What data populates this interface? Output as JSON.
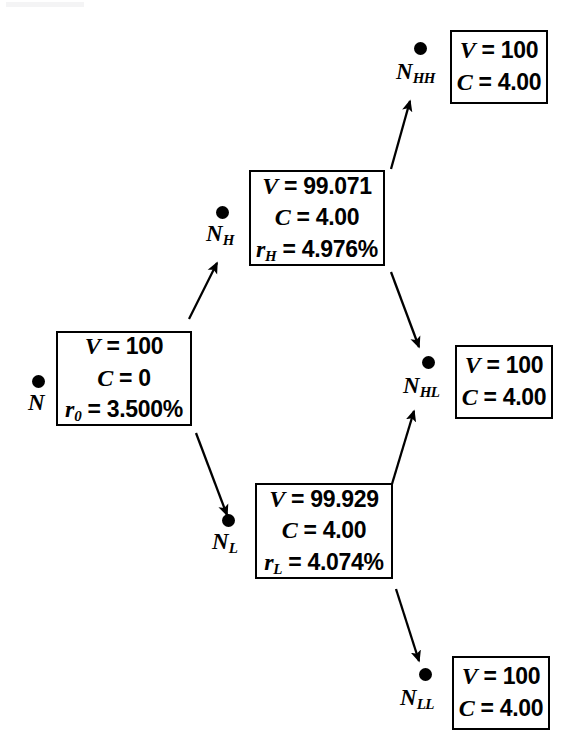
{
  "diagram": {
    "type": "binomial-tree",
    "ink_color": "#000000",
    "background_color": "#ffffff"
  },
  "nodes": [
    {
      "id": "N",
      "label": "N",
      "subscript": "",
      "dot": {
        "x": 38,
        "y": 381
      },
      "label_pos": {
        "x": 28,
        "y": 391
      },
      "box": {
        "x": 56,
        "y": 331,
        "w": 136,
        "h": 95
      },
      "lines": [
        {
          "sym": "V",
          "sub": "",
          "rest": " = 100"
        },
        {
          "sym": "C",
          "sub": "",
          "rest": " = 0"
        },
        {
          "sym": "r",
          "sub": "0",
          "rest": " = 3.500%"
        }
      ]
    },
    {
      "id": "NH",
      "label": "N",
      "subscript": "H",
      "dot": {
        "x": 222,
        "y": 212
      },
      "label_pos": {
        "x": 206,
        "y": 222
      },
      "box": {
        "x": 249,
        "y": 170,
        "w": 136,
        "h": 96
      },
      "lines": [
        {
          "sym": "V",
          "sub": "",
          "rest": " = 99.071"
        },
        {
          "sym": "C",
          "sub": "",
          "rest": " = 4.00"
        },
        {
          "sym": "r",
          "sub": "H",
          "rest": " = 4.976%"
        }
      ]
    },
    {
      "id": "NL",
      "label": "N",
      "subscript": "L",
      "dot": {
        "x": 228,
        "y": 520
      },
      "label_pos": {
        "x": 212,
        "y": 530
      },
      "box": {
        "x": 255,
        "y": 483,
        "w": 138,
        "h": 96
      },
      "lines": [
        {
          "sym": "V",
          "sub": "",
          "rest": " = 99.929"
        },
        {
          "sym": "C",
          "sub": "",
          "rest": " = 4.00"
        },
        {
          "sym": "r",
          "sub": "L",
          "rest": " = 4.074%"
        }
      ]
    },
    {
      "id": "NHH",
      "label": "N",
      "subscript": "HH",
      "dot": {
        "x": 420,
        "y": 48
      },
      "label_pos": {
        "x": 396,
        "y": 60
      },
      "box": {
        "x": 450,
        "y": 30,
        "w": 98,
        "h": 74
      },
      "lines": [
        {
          "sym": "V",
          "sub": "",
          "rest": " = 100"
        },
        {
          "sym": "C",
          "sub": "",
          "rest": " = 4.00"
        }
      ]
    },
    {
      "id": "NHL",
      "label": "N",
      "subscript": "HL",
      "dot": {
        "x": 428,
        "y": 362
      },
      "label_pos": {
        "x": 403,
        "y": 374
      },
      "box": {
        "x": 455,
        "y": 345,
        "w": 98,
        "h": 74
      },
      "lines": [
        {
          "sym": "V",
          "sub": "",
          "rest": " = 100"
        },
        {
          "sym": "C",
          "sub": "",
          "rest": " = 4.00"
        }
      ]
    },
    {
      "id": "NLL",
      "label": "N",
      "subscript": "LL",
      "dot": {
        "x": 425,
        "y": 674
      },
      "label_pos": {
        "x": 400,
        "y": 686
      },
      "box": {
        "x": 452,
        "y": 656,
        "w": 98,
        "h": 74
      },
      "lines": [
        {
          "sym": "V",
          "sub": "",
          "rest": " = 100"
        },
        {
          "sym": "C",
          "sub": "",
          "rest": " = 4.00"
        }
      ]
    }
  ],
  "edges": [
    {
      "id": "N-to-NH",
      "from": "N",
      "to": "NH",
      "x1": 189,
      "y1": 319,
      "x2": 217,
      "y2": 263
    },
    {
      "id": "N-to-NL",
      "from": "N",
      "to": "NL",
      "x1": 196,
      "y1": 433,
      "x2": 227,
      "y2": 515
    },
    {
      "id": "NH-to-NHH",
      "from": "NH",
      "to": "NHH",
      "x1": 391,
      "y1": 169,
      "x2": 410,
      "y2": 101
    },
    {
      "id": "NH-to-NHL",
      "from": "NH",
      "to": "NHL",
      "x1": 391,
      "y1": 272,
      "x2": 419,
      "y2": 347
    },
    {
      "id": "NL-to-NHL",
      "from": "NL",
      "to": "NHL",
      "x1": 392,
      "y1": 484,
      "x2": 414,
      "y2": 411
    },
    {
      "id": "NL-to-NLL",
      "from": "NL",
      "to": "NLL",
      "x1": 396,
      "y1": 589,
      "x2": 419,
      "y2": 661
    }
  ]
}
